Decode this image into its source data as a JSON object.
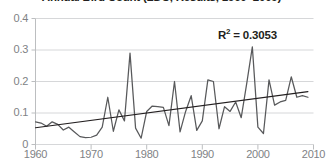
{
  "chart_data": {
    "type": "line",
    "title": "Annual Bird Count (LDC, Results, 1960–2009)",
    "xlabel": "",
    "ylabel": "",
    "xlim": [
      1960,
      2010
    ],
    "ylim": [
      0,
      0.4
    ],
    "grid": true,
    "grid_axis": "y",
    "legend": "none",
    "x_ticks": [
      "1960",
      "1970",
      "1980",
      "1990",
      "2000",
      "2010"
    ],
    "x_tick_values": [
      1960,
      1970,
      1980,
      1990,
      2000,
      2010
    ],
    "y_ticks": [
      "0",
      "0.1",
      "0.2",
      "0.3",
      "0.4"
    ],
    "y_tick_values": [
      0,
      0.1,
      0.2,
      0.3,
      0.4
    ],
    "annotations": [
      {
        "name": "r-squared",
        "prefix": "R",
        "superscript": "2",
        "suffix": " = 0.3053",
        "value": 0.3053
      }
    ],
    "series": [
      {
        "name": "annual-value",
        "type": "line",
        "color": "#58595b",
        "x": [
          1960,
          1961,
          1962,
          1963,
          1964,
          1965,
          1966,
          1967,
          1968,
          1969,
          1970,
          1971,
          1972,
          1973,
          1974,
          1975,
          1976,
          1977,
          1978,
          1979,
          1980,
          1981,
          1982,
          1983,
          1984,
          1985,
          1986,
          1987,
          1988,
          1989,
          1990,
          1991,
          1992,
          1993,
          1994,
          1995,
          1996,
          1997,
          1998,
          1999,
          2000,
          2001,
          2002,
          2003,
          2004,
          2005,
          2006,
          2007,
          2008,
          2009
        ],
        "values": [
          0.072,
          0.068,
          0.058,
          0.072,
          0.064,
          0.046,
          0.055,
          0.04,
          0.025,
          0.022,
          0.023,
          0.03,
          0.055,
          0.15,
          0.042,
          0.11,
          0.075,
          0.29,
          0.052,
          0.02,
          0.105,
          0.122,
          0.12,
          0.118,
          0.06,
          0.2,
          0.04,
          0.105,
          0.155,
          0.045,
          0.075,
          0.205,
          0.2,
          0.05,
          0.12,
          0.105,
          0.135,
          0.085,
          0.195,
          0.31,
          0.055,
          0.035,
          0.205,
          0.125,
          0.135,
          0.14,
          0.215,
          0.15,
          0.155,
          0.15
        ]
      },
      {
        "name": "linear-trendline",
        "type": "line",
        "color": "#231f20",
        "x": [
          1960,
          2009
        ],
        "values": [
          0.053,
          0.168
        ]
      }
    ]
  }
}
